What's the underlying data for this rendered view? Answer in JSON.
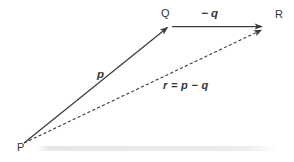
{
  "diagram": {
    "type": "vector-triangle",
    "background_color": "#ffffff",
    "stroke_color": "#3a3a40",
    "points": [
      {
        "id": "P",
        "label": "P",
        "x": 24,
        "y": 143
      },
      {
        "id": "Q",
        "label": "Q",
        "x": 170,
        "y": 26
      },
      {
        "id": "R",
        "label": "R",
        "x": 266,
        "y": 27
      }
    ],
    "vectors": [
      {
        "id": "p",
        "label": "p",
        "from": "P",
        "to": "Q",
        "style": "solid",
        "arrowhead": "end"
      },
      {
        "id": "minus-q",
        "label": "− q",
        "from": "Q",
        "to": "R",
        "style": "solid",
        "arrowhead": "end"
      },
      {
        "id": "r",
        "label": "r = p − q",
        "from": "P",
        "to": "R",
        "style": "dashed",
        "arrowhead": "end"
      }
    ]
  }
}
